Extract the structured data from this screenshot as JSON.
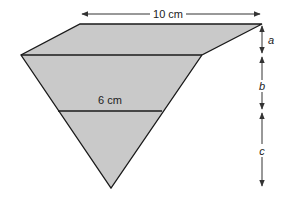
{
  "diagram": {
    "fill_color": "#c9c9c9",
    "stroke_color": "#1a1a1a",
    "arrow_color": "#333333",
    "top_width_label": "10 cm",
    "middle_width_label": "6 cm",
    "height_labels": {
      "a": "a",
      "b": "b",
      "c": "c"
    },
    "shape": {
      "top_left": [
        80,
        24
      ],
      "top_right": [
        262,
        24
      ],
      "left": [
        21,
        55
      ],
      "right": [
        202,
        55
      ],
      "lower_left": [
        58,
        111
      ],
      "lower_right": [
        162,
        111
      ],
      "bottom": [
        111,
        188
      ]
    }
  }
}
